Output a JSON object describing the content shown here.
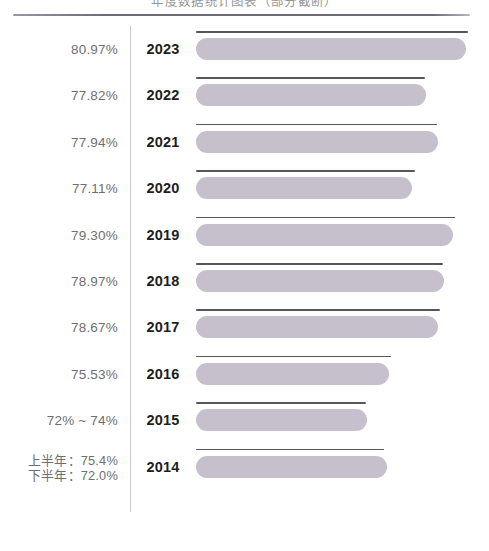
{
  "header": {
    "clipped_title": "年度数据统计图表（部分截断）",
    "rule_color": "#6f6b78"
  },
  "colors": {
    "bar_fill": "#c6c0cc",
    "cap_line": "#56545c",
    "divider": "#c9c9cf",
    "percent_text": "#6e6e72",
    "year_text": "#1d1d1f"
  },
  "chart_data": {
    "type": "bar",
    "title": "",
    "xlabel": "",
    "ylabel": "",
    "orientation": "horizontal",
    "grid": false,
    "legend": null,
    "categories": [
      "2023",
      "2022",
      "2021",
      "2020",
      "2019",
      "2018",
      "2017",
      "2016",
      "2015",
      "2014"
    ],
    "values": [
      80.97,
      77.82,
      77.94,
      77.11,
      79.3,
      78.97,
      78.67,
      75.53,
      73.0,
      73.7
    ],
    "value_labels": [
      "80.97%",
      "77.82%",
      "77.94%",
      "77.11%",
      "79.30%",
      "78.97%",
      "78.67%",
      "75.53%",
      "72% ~ 74%",
      "上半年：75.4%\n下半年：72.0%"
    ],
    "rows": [
      {
        "year": "2023",
        "percent_label": "80.97%",
        "percent_lines": [
          "80.97%"
        ],
        "value": 80.97,
        "bar_width": 270,
        "cap_width": 272
      },
      {
        "year": "2022",
        "percent_label": "77.82%",
        "percent_lines": [
          "77.82%"
        ],
        "value": 77.82,
        "bar_width": 230,
        "cap_width": 229
      },
      {
        "year": "2021",
        "percent_label": "77.94%",
        "percent_lines": [
          "77.94%"
        ],
        "value": 77.94,
        "bar_width": 242,
        "cap_width": 241
      },
      {
        "year": "2020",
        "percent_label": "77.11%",
        "percent_lines": [
          "77.11%"
        ],
        "value": 77.11,
        "bar_width": 216,
        "cap_width": 219
      },
      {
        "year": "2019",
        "percent_label": "79.30%",
        "percent_lines": [
          "79.30%"
        ],
        "value": 79.3,
        "bar_width": 257,
        "cap_width": 259
      },
      {
        "year": "2018",
        "percent_label": "78.97%",
        "percent_lines": [
          "78.97%"
        ],
        "value": 78.97,
        "bar_width": 248,
        "cap_width": 247
      },
      {
        "year": "2017",
        "percent_label": "78.67%",
        "percent_lines": [
          "78.67%"
        ],
        "value": 78.67,
        "bar_width": 242,
        "cap_width": 244
      },
      {
        "year": "2016",
        "percent_label": "75.53%",
        "percent_lines": [
          "75.53%"
        ],
        "value": 75.53,
        "bar_width": 193,
        "cap_width": 195
      },
      {
        "year": "2015",
        "percent_label": "72% ~ 74%",
        "percent_lines": [
          "72% ~ 74%"
        ],
        "value": 73.0,
        "bar_width": 171,
        "cap_width": 170
      },
      {
        "year": "2014",
        "percent_label": "上半年：75.4% / 下半年：72.0%",
        "percent_lines": [
          "上半年：75.4%",
          "下半年：72.0%"
        ],
        "value": 73.7,
        "bar_width": 191,
        "cap_width": 188
      }
    ]
  }
}
